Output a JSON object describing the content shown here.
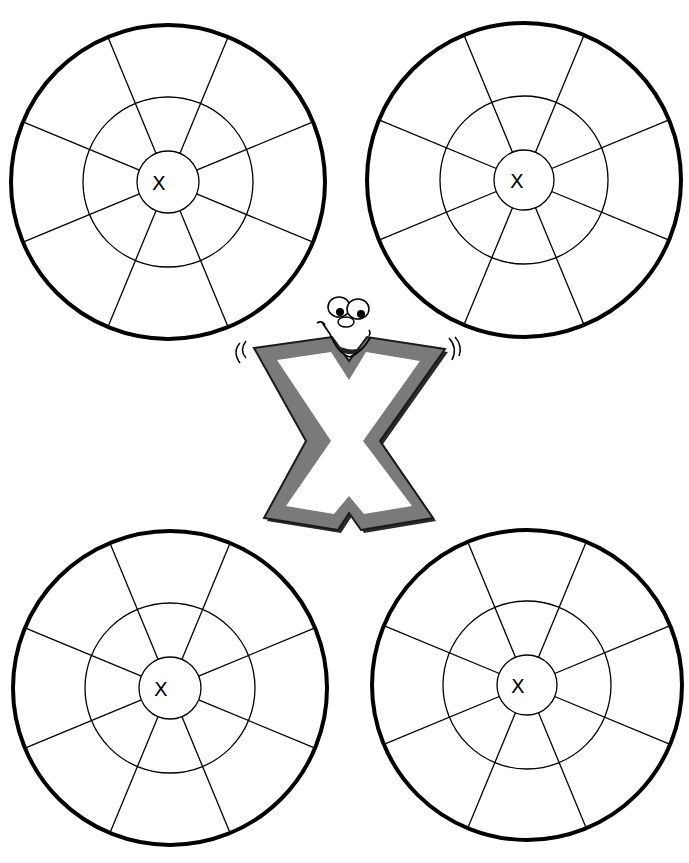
{
  "worksheet": {
    "title_clipped": "",
    "letter": "X",
    "colors": {
      "outline": "#000000",
      "letter_fill": "#7a7a7a",
      "letter_shadow": "#2a2a2a",
      "background": "#ffffff"
    },
    "wheels": [
      {
        "name": "top-left",
        "cx": 168,
        "cy": 182,
        "r_outer": 157,
        "r_middle": 85,
        "r_inner": 31,
        "label": "X",
        "label_x": 152,
        "label_y": 190
      },
      {
        "name": "top-right",
        "cx": 524,
        "cy": 180,
        "r_outer": 157,
        "r_middle": 84,
        "r_inner": 30,
        "label": "X",
        "label_x": 510,
        "label_y": 188
      },
      {
        "name": "bottom-left",
        "cx": 170,
        "cy": 688,
        "r_outer": 157,
        "r_middle": 85,
        "r_inner": 31,
        "label": "X",
        "label_x": 154,
        "label_y": 696
      },
      {
        "name": "bottom-right",
        "cx": 527,
        "cy": 685,
        "r_outer": 155,
        "r_middle": 84,
        "r_inner": 30,
        "label": "X",
        "label_x": 511,
        "label_y": 693
      }
    ],
    "spokes_per_wheel": 8,
    "mascot": {
      "description": "Cartoon letter X with face",
      "letter": "X"
    }
  }
}
